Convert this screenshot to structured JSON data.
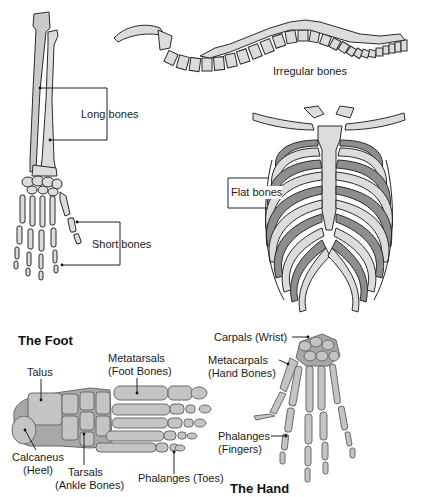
{
  "figure": {
    "sections": {
      "bone_types": {
        "labels": {
          "long_bones": "Long bones",
          "irregular_bones": "Irregular bones",
          "flat_bones": "Flat bones",
          "short_bones": "Short bones"
        }
      },
      "foot": {
        "title": "The Foot",
        "labels": {
          "talus": "Talus",
          "metatarsals_line1": "Metatarsals",
          "metatarsals_line2": "(Foot Bones)",
          "calcaneus_line1": "Calcaneus",
          "calcaneus_line2": "(Heel)",
          "tarsals_line1": "Tarsals",
          "tarsals_line2": "(Ankle Bones)",
          "phalanges": "Phalanges (Toes)"
        }
      },
      "hand": {
        "title": "The Hand",
        "labels": {
          "carpals": "Carpals (Wrist)",
          "metacarpals_line1": "Metacarpals",
          "metacarpals_line2": "(Hand Bones)",
          "phalanges_line1": "Phalanges",
          "phalanges_line2": "(Fingers)"
        }
      }
    }
  }
}
